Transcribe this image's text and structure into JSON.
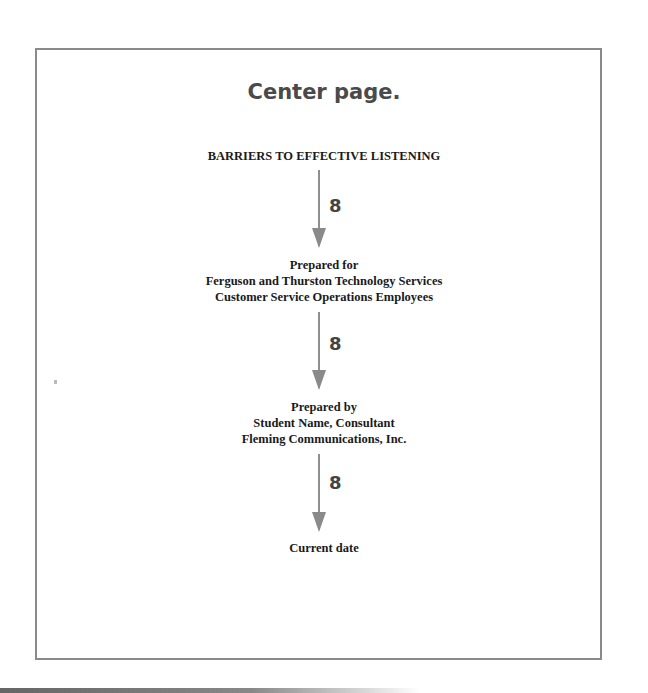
{
  "heading": "Center page.",
  "title": "BARRIERS TO EFFECTIVE LISTENING",
  "prepared_for": {
    "label": "Prepared for",
    "line1": "Ferguson and Thurston Technology Services",
    "line2": "Customer Service Operations Employees"
  },
  "prepared_by": {
    "label": "Prepared by",
    "line1": "Student Name, Consultant",
    "line2": "Fleming Communications, Inc."
  },
  "date": "Current date",
  "spacing_annotations": [
    "8",
    "8",
    "8"
  ],
  "colors": {
    "frame_border": "#8a8a8a",
    "arrow": "#8f8f8f",
    "heading_text": "#4a4a4a",
    "body_text": "#1a1a1a"
  }
}
